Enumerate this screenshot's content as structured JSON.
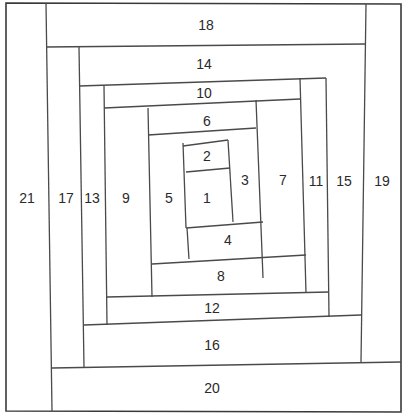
{
  "diagram": {
    "colors": {
      "line": "#4a4a4a",
      "frame": "#3a3a3a",
      "text": "#2a2a2a",
      "background": "#ffffff"
    },
    "frame": [
      [
        6,
        3
      ],
      [
        401,
        4
      ],
      [
        401,
        412
      ],
      [
        6,
        411
      ]
    ],
    "seams": [
      [
        46,
        3,
        52,
        411
      ],
      [
        46,
        47,
        366,
        44
      ],
      [
        366,
        4,
        361,
        362
      ],
      [
        52,
        368,
        401,
        362
      ],
      [
        79,
        47,
        84,
        368
      ],
      [
        79,
        86,
        326,
        78
      ],
      [
        326,
        78,
        329,
        317
      ],
      [
        84,
        325,
        361,
        315
      ],
      [
        104,
        86,
        107,
        325
      ],
      [
        104,
        108,
        300,
        99
      ],
      [
        300,
        78,
        306,
        293
      ],
      [
        107,
        297,
        329,
        292
      ],
      [
        148,
        108,
        152,
        297
      ],
      [
        148,
        135,
        256,
        128
      ],
      [
        256,
        100,
        263,
        278
      ],
      [
        152,
        264,
        306,
        255
      ],
      [
        183,
        143,
        186,
        228
      ],
      [
        183,
        146,
        228,
        140
      ],
      [
        228,
        140,
        233,
        222
      ],
      [
        186,
        228,
        263,
        222
      ],
      [
        186,
        172,
        230,
        168
      ],
      [
        187,
        228,
        189,
        259
      ]
    ],
    "pieces": [
      {
        "id": "1",
        "x": 207,
        "y": 198
      },
      {
        "id": "2",
        "x": 207,
        "y": 156
      },
      {
        "id": "3",
        "x": 245,
        "y": 180
      },
      {
        "id": "4",
        "x": 228,
        "y": 240
      },
      {
        "id": "5",
        "x": 169,
        "y": 198
      },
      {
        "id": "6",
        "x": 207,
        "y": 121
      },
      {
        "id": "7",
        "x": 283,
        "y": 180
      },
      {
        "id": "8",
        "x": 221,
        "y": 276
      },
      {
        "id": "9",
        "x": 126,
        "y": 198
      },
      {
        "id": "10",
        "x": 204,
        "y": 93
      },
      {
        "id": "11",
        "x": 316,
        "y": 181
      },
      {
        "id": "12",
        "x": 212,
        "y": 308
      },
      {
        "id": "13",
        "x": 92,
        "y": 198
      },
      {
        "id": "14",
        "x": 204,
        "y": 64
      },
      {
        "id": "15",
        "x": 344,
        "y": 181
      },
      {
        "id": "16",
        "x": 212,
        "y": 345
      },
      {
        "id": "17",
        "x": 66,
        "y": 198
      },
      {
        "id": "18",
        "x": 206,
        "y": 25
      },
      {
        "id": "19",
        "x": 382,
        "y": 181
      },
      {
        "id": "20",
        "x": 212,
        "y": 388
      },
      {
        "id": "21",
        "x": 27,
        "y": 198
      }
    ]
  }
}
